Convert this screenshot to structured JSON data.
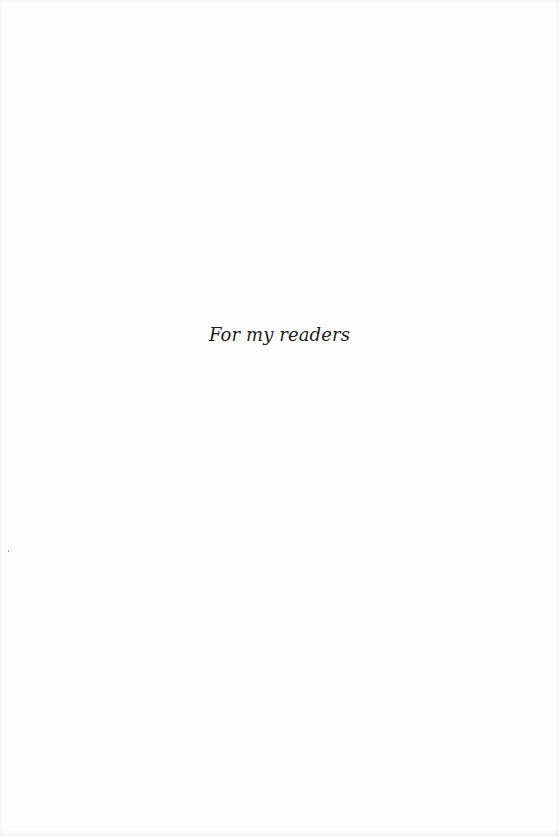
{
  "page": {
    "type": "dedication",
    "dedication_text": "For my readers"
  }
}
